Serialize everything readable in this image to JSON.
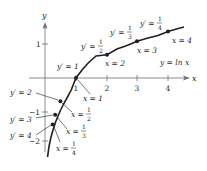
{
  "figure": {
    "curve_label": "y = ln x",
    "axis_labels": {
      "x": "x",
      "y": "y"
    },
    "x_ticks": [
      "1",
      "2",
      "3",
      "4"
    ],
    "y_ticks": [
      "1",
      "−1",
      "−2"
    ],
    "points": [
      {
        "x_label": "x = 1/4",
        "x_num": "1",
        "x_den": "4",
        "slope_label": "y′ = 4"
      },
      {
        "x_label": "x = 1/3",
        "x_num": "1",
        "x_den": "3",
        "slope_label": "y′ = 3"
      },
      {
        "x_label": "x = 1/2",
        "x_num": "1",
        "x_den": "2",
        "slope_label": "y′ = 2"
      },
      {
        "x_label": "x = 1",
        "slope_label": "y′ = 1"
      },
      {
        "x_label": "x = 2",
        "slope_label": "y′ = 1/2",
        "s_num": "1",
        "s_den": "2"
      },
      {
        "x_label": "x = 3",
        "slope_label": "y′ = 1/3",
        "s_num": "1",
        "s_den": "3"
      },
      {
        "x_label": "x = 4",
        "slope_label": "y′ = 1/4",
        "s_num": "1",
        "s_den": "4"
      }
    ]
  },
  "text": {
    "x_eq": "x =",
    "yp_eq": "y′ =",
    "x1": "x = 1",
    "x2": "x = 2",
    "x3": "x = 3",
    "x4": "x = 4",
    "yp1": "y′ = 1",
    "yp2": "y′ = 2",
    "yp3": "y′ = 3",
    "yp4": "y′ = 4",
    "one": "1"
  },
  "colors": {
    "ink": "#231f20",
    "axis": "#6d6e71",
    "background": "#ffffff"
  }
}
